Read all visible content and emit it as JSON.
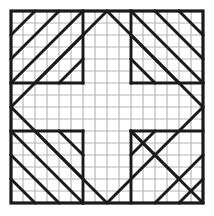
{
  "figure": {
    "width": 214,
    "height": 216
  },
  "canvas": {
    "background_color": "#ffffff",
    "origin_x": 11,
    "origin_y": 11,
    "size": 192,
    "cell": 12,
    "divisions": 16
  },
  "style": {
    "grid_color": "#b3b3b3",
    "grid_width": 1.1,
    "border_color": "#1a1a1a",
    "border_width": 3.2,
    "line_color": "#1a1a1a",
    "line_width": 2.9,
    "thin_line_width": 2.2
  },
  "geometry": {
    "grid_vertical_lines": [
      0,
      1,
      2,
      3,
      4,
      5,
      6,
      7,
      8,
      9,
      10,
      11,
      12,
      13,
      14,
      15,
      16
    ],
    "grid_horizontal_lines": [
      0,
      1,
      2,
      3,
      4,
      5,
      6,
      7,
      8,
      9,
      10,
      11,
      12,
      13,
      14,
      15,
      16
    ],
    "border_rect": [
      0,
      0,
      16,
      16
    ],
    "central_diamond": [
      [
        8,
        0
      ],
      [
        16,
        8
      ],
      [
        8,
        16
      ],
      [
        0,
        8
      ]
    ],
    "segments": [
      [
        0,
        4,
        4,
        0
      ],
      [
        0,
        2,
        2,
        0
      ],
      [
        2,
        6,
        6,
        2
      ],
      [
        0,
        6,
        6,
        0
      ],
      [
        0,
        6,
        6,
        6
      ],
      [
        6,
        0,
        6,
        6
      ],
      [
        4,
        6,
        6,
        4
      ],
      [
        12,
        0,
        16,
        4
      ],
      [
        14,
        0,
        16,
        2
      ],
      [
        10,
        2,
        14,
        6
      ],
      [
        10,
        0,
        16,
        6
      ],
      [
        10,
        6,
        16,
        6
      ],
      [
        10,
        0,
        10,
        6
      ],
      [
        10,
        4,
        12,
        6
      ],
      [
        0,
        12,
        4,
        16
      ],
      [
        0,
        14,
        2,
        16
      ],
      [
        2,
        10,
        6,
        14
      ],
      [
        0,
        10,
        6,
        16
      ],
      [
        0,
        10,
        6,
        10
      ],
      [
        6,
        10,
        6,
        16
      ],
      [
        4,
        10,
        6,
        12
      ],
      [
        16,
        12,
        12,
        16
      ],
      [
        16,
        14,
        14,
        16
      ],
      [
        10,
        10,
        14,
        14
      ],
      [
        10,
        10,
        16,
        16
      ],
      [
        10,
        10,
        16,
        10
      ],
      [
        10,
        10,
        10,
        16
      ],
      [
        10,
        12,
        12,
        10
      ]
    ]
  },
  "labels": {
    "figure_caption": ""
  }
}
